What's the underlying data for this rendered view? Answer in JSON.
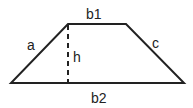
{
  "diagram": {
    "shape": "trapezoid",
    "labels": {
      "top_base": "b1",
      "bottom_base": "b2",
      "left_side": "a",
      "right_side": "c",
      "height": "h"
    },
    "colors": {
      "stroke": "#222222",
      "background": "#ffffff"
    }
  }
}
